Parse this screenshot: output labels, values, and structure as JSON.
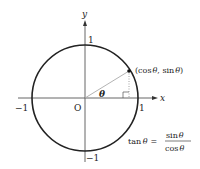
{
  "axes": {
    "x_label": "x",
    "y_label": "y",
    "origin_label": "O",
    "tick_pos_x": "1",
    "tick_neg_x": "−1",
    "tick_pos_y": "1",
    "tick_neg_y": "−1"
  },
  "point": {
    "label": "(cos θ, sin θ)",
    "label_open": "(cos",
    "label_theta1": "θ",
    "label_mid": ", sin",
    "label_theta2": "θ",
    "label_close": ")"
  },
  "angle": {
    "label": "θ"
  },
  "formula": {
    "lhs_fn": "tan",
    "lhs_var": "θ",
    "equals": "=",
    "numerator_fn": "sin",
    "numerator_var": "θ",
    "denominator_fn": "cos",
    "denominator_var": "θ"
  },
  "colors": {
    "circle": "#222222",
    "axis": "#555555",
    "radius": "#aaaaaa",
    "dotted": "#888888",
    "text": "#222222"
  }
}
